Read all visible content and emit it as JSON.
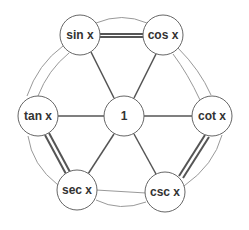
{
  "diagram": {
    "center": {
      "label": "1"
    },
    "nodes": [
      {
        "id": "sin",
        "label": "sin x"
      },
      {
        "id": "cos",
        "label": "cos x"
      },
      {
        "id": "tan",
        "label": "tan x"
      },
      {
        "id": "cot",
        "label": "cot x"
      },
      {
        "id": "sec",
        "label": "sec x"
      },
      {
        "id": "csc",
        "label": "csc x"
      }
    ],
    "edges": [
      {
        "from": "sin",
        "to": "cos",
        "style": "thick-double"
      },
      {
        "from": "tan",
        "to": "sec",
        "style": "thick-double"
      },
      {
        "from": "cot",
        "to": "csc",
        "style": "thick-double"
      },
      {
        "from": "sin",
        "to": "tan",
        "style": "thin-double"
      },
      {
        "from": "cos",
        "to": "cot",
        "style": "thin-double"
      },
      {
        "from": "sec",
        "to": "csc",
        "style": "thin-double"
      },
      {
        "from": "1",
        "to": "sin",
        "style": "spoke"
      },
      {
        "from": "1",
        "to": "cos",
        "style": "spoke"
      },
      {
        "from": "1",
        "to": "tan",
        "style": "spoke"
      },
      {
        "from": "1",
        "to": "cot",
        "style": "spoke"
      },
      {
        "from": "1",
        "to": "sec",
        "style": "spoke"
      },
      {
        "from": "1",
        "to": "csc",
        "style": "spoke"
      }
    ],
    "colors": {
      "stroke": "#555555",
      "thin": "#888888",
      "text": "#333333"
    }
  }
}
